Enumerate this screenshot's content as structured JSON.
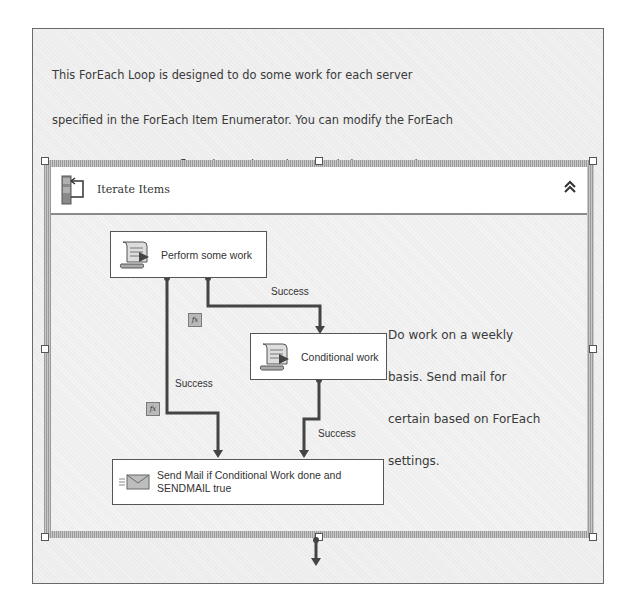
{
  "annotation": {
    "lines": [
      "This ForEach Loop is designed to do some work for each server",
      "specified in the ForEach Item Enumerator. You can modify the ForEach",
      "Item Enumerator to reflect the work you have to do in your environment.",
      "Or you can run this package unchanged and it will execute the sample",
      "workflow for you. Make sure you change the email address in the Send Mail task.",
      "The SendMail task will only send an email if the conditional workflow executes",
      "and the SENDMAIL variable is true based on the ForEach Item Column 2 setting."
    ]
  },
  "container": {
    "title": "Iterate Items",
    "icon": "foreach-loop-icon",
    "collapse_icon": "double-chevron-up-icon",
    "collapse_glyph": "≪"
  },
  "tasks": [
    {
      "id": "perform",
      "label": "Perform some work",
      "icon": "script-task-icon"
    },
    {
      "id": "conditional",
      "label": "Conditional work",
      "icon": "script-task-icon"
    },
    {
      "id": "sendmail",
      "label": "Send Mail if Conditional Work done and SENDMAIL true",
      "icon": "send-mail-task-icon"
    }
  ],
  "constraints": [
    {
      "from": "perform",
      "to": "conditional",
      "label": "Success",
      "has_expression": true
    },
    {
      "from": "perform",
      "to": "sendmail",
      "label": "Success",
      "has_expression": true
    },
    {
      "from": "conditional",
      "to": "sendmail",
      "label": "Success",
      "has_expression": false
    }
  ],
  "fx_label": "fx",
  "comment": {
    "lines": [
      "Do work on a weekly",
      "basis. Send mail for",
      "certain based on ForEach",
      "settings."
    ]
  }
}
